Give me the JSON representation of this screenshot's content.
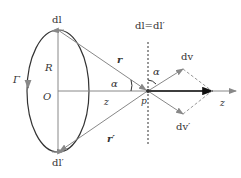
{
  "labels": {
    "dl_top": "dl",
    "dl_eq": "dl=dl′",
    "r": "r",
    "r_prime": "r′",
    "R": "R",
    "O": "O",
    "Gamma": "Γ",
    "alpha_left": "α",
    "alpha_right": "α",
    "z_mid": "z",
    "z_axis": "z",
    "P": "p",
    "dv": "dv",
    "dv_prime": "dv′",
    "dl_bottom": "dl′"
  },
  "colors": {
    "curve": "#333333",
    "line": "#888888",
    "axis": "#222222"
  }
}
